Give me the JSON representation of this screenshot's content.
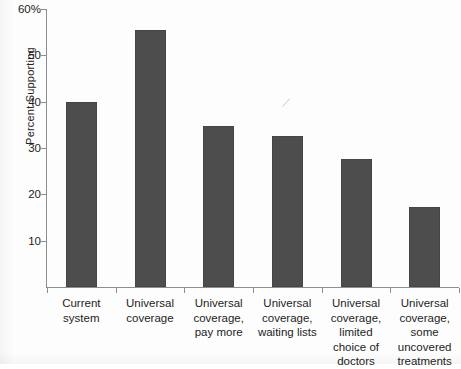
{
  "chart_data": {
    "type": "bar",
    "title": "",
    "subtitle": "",
    "xlabel": "",
    "ylabel": "Percent Supporting",
    "categories": [
      "Current system",
      "Universal coverage",
      "Universal coverage, pay more",
      "Universal coverage, waiting lists",
      "Universal coverage, limited choice of doctors",
      "Universal coverage, some uncovered treatments"
    ],
    "category_lines": [
      [
        "Current",
        "system"
      ],
      [
        "Universal",
        "coverage"
      ],
      [
        "Universal",
        "coverage,",
        "pay more"
      ],
      [
        "Universal",
        "coverage,",
        "waiting lists"
      ],
      [
        "Universal",
        "coverage,",
        "limited",
        "choice of",
        "doctors"
      ],
      [
        "Universal",
        "coverage,",
        "some",
        "uncovered",
        "treatments"
      ]
    ],
    "values": [
      40.0,
      55.5,
      34.7,
      32.7,
      27.7,
      17.3
    ],
    "ylim": [
      0,
      60
    ],
    "ytick_values": [
      10,
      20,
      30,
      40,
      50,
      60
    ],
    "ytick_labels": [
      "10",
      "20",
      "30",
      "40",
      "50",
      "60%"
    ],
    "grid": false,
    "legend": false,
    "legend_position": "none",
    "bar_color": "#4d4d4d",
    "axis_color": "#8e8e8e",
    "background_color": "#fdfdfd"
  },
  "artifacts": {
    "bottom_text": "",
    "scan_mark": "pencil-stroke"
  }
}
